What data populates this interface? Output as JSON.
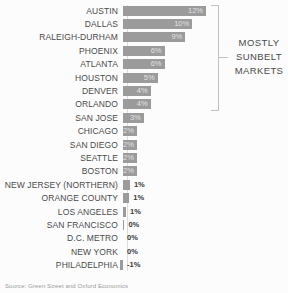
{
  "chart_data": {
    "type": "bar",
    "orientation": "horizontal",
    "title": "",
    "xlabel": "",
    "ylabel": "",
    "categories": [
      "AUSTIN",
      "DALLAS",
      "RALEIGH-DURHAM",
      "PHOENIX",
      "ATLANTA",
      "HOUSTON",
      "DENVER",
      "ORLANDO",
      "SAN JOSE",
      "CHICAGO",
      "SAN DIEGO",
      "SEATTLE",
      "BOSTON",
      "NEW JERSEY (NORTHERN)",
      "ORANGE COUNTY",
      "LOS ANGELES",
      "SAN FRANCISCO",
      "D.C. METRO",
      "NEW YORK",
      "PHILADELPHIA"
    ],
    "values": [
      12,
      10,
      9,
      6,
      6,
      5,
      4,
      4,
      3,
      2,
      2,
      2,
      2,
      1,
      1,
      1,
      0,
      0,
      0,
      -1
    ],
    "value_labels": [
      "12%",
      "10%",
      "9%",
      "6%",
      "6%",
      "5%",
      "4%",
      "4%",
      "3%",
      "2%",
      "2%",
      "2%",
      "2%",
      "1%",
      "1%",
      "1%",
      "0%",
      "0%",
      "0%",
      "-1%"
    ],
    "bar_lengths_pct": [
      12,
      10,
      9,
      6,
      6,
      5,
      4,
      4,
      3,
      2,
      2,
      2,
      2,
      1,
      0.9,
      0.45,
      0.2,
      0,
      0,
      -0.5
    ],
    "xlim": [
      -1,
      12
    ],
    "grid": false,
    "legend": "none",
    "bar_color": "#9b9b9b",
    "annotation_bracket_rows": [
      "AUSTIN",
      "ORLANDO"
    ]
  },
  "annotation": {
    "lines": [
      "MOSTLY",
      "SUNBELT",
      "MARKETS"
    ]
  },
  "source": "Source: Green Street and Oxford Economics",
  "colors": {
    "bar": "#9b9b9b",
    "label_text": "#4a4a4a",
    "value_inside_text": "#e2e2e2",
    "value_outside_text": "#3a3a3a",
    "bracket": "#c2c2c2",
    "axis": "#dcdcdc",
    "background": "#fcfcfc"
  }
}
